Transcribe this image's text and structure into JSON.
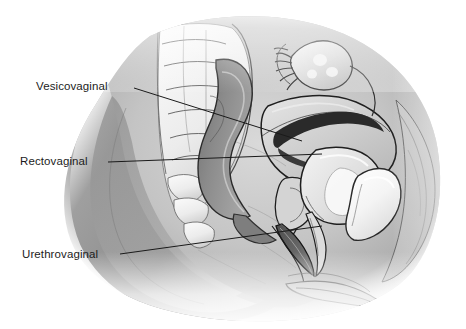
{
  "figure": {
    "background_color": "#ffffff",
    "width": 466,
    "height": 329,
    "style": "grayscale medical line-and-wash illustration"
  },
  "labels": [
    {
      "id": "vesicovaginal",
      "text": "Vesicovaginal",
      "text_color": "#1c1c1c",
      "leader_from": [
        134,
        88
      ],
      "leader_to": [
        302,
        141
      ]
    },
    {
      "id": "rectovaginal",
      "text": "Rectovaginal",
      "text_color": "#1c1c1c",
      "leader_from": [
        108,
        162
      ],
      "leader_to": [
        322,
        154
      ]
    },
    {
      "id": "urethrovaginal",
      "text": "Urethrovaginal",
      "text_color": "#1c1c1c",
      "leader_from": [
        120,
        254
      ],
      "leader_to": [
        322,
        226
      ]
    }
  ],
  "anatomy": {
    "structures": [
      "body-silhouette",
      "sacrum-vertebrae",
      "rectum",
      "uterus",
      "uterine-cavity",
      "ovary",
      "fallopian-tube-fimbriae",
      "bladder",
      "urethra",
      "vagina",
      "pubic-bone",
      "anterior-abdominal-wall",
      "perineum"
    ],
    "leader_line_color": "#1a1a1a",
    "outline_color": "#1a1a1a",
    "tone_light": "#e8e8e8",
    "tone_mid": "#b9b9b9",
    "tone_dark": "#8a8a8a",
    "tone_darkest": "#5e5e5e"
  }
}
